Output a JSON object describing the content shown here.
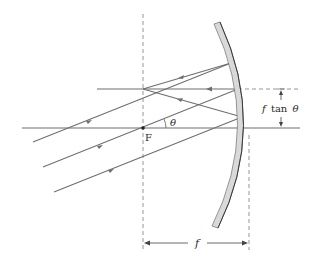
{
  "diagram": {
    "type": "concave-mirror-ray-diagram",
    "labels": {
      "focal_point": "F",
      "angle": "θ",
      "height": "f tan θ",
      "height_f": "f",
      "height_tan": "tan",
      "height_theta": "θ",
      "focal_length": "f"
    },
    "colors": {
      "ray": "#6e6e6e",
      "axis": "#6e6e6e",
      "dashed": "#8a8a8a",
      "mirror_fill": "#d9d9d9",
      "mirror_edge": "#7a7a7a",
      "mirror_back": "#3a3a3a",
      "text": "#2a2a2a"
    }
  }
}
